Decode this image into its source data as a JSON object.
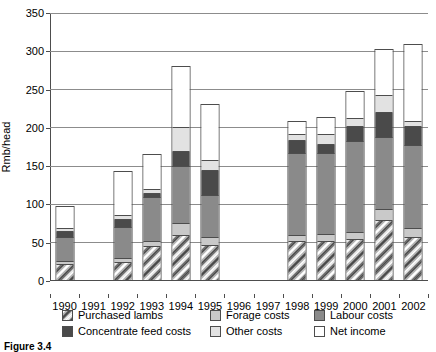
{
  "chart_data": {
    "type": "bar",
    "stacked": true,
    "title": "",
    "xlabel": "",
    "ylabel": "Rmb/head",
    "ylim": [
      0,
      350
    ],
    "yticks": [
      0,
      50,
      100,
      150,
      200,
      250,
      300,
      350
    ],
    "grid": true,
    "legend_position": "bottom",
    "categories": [
      "1990",
      "1991",
      "1992",
      "1993",
      "1994",
      "1995",
      "1996",
      "1997",
      "1998",
      "1999",
      "2000",
      "2001",
      "2002"
    ],
    "series": [
      {
        "name": "Purchased lambs",
        "color": "#808080",
        "values": [
          20,
          null,
          22,
          43,
          57,
          45,
          null,
          null,
          49,
          50,
          52,
          77,
          55
        ]
      },
      {
        "name": "Forage costs",
        "color": "#c9c9c9",
        "values": [
          4,
          null,
          5,
          7,
          16,
          10,
          null,
          null,
          8,
          9,
          10,
          14,
          12
        ]
      },
      {
        "name": "Labour costs",
        "color": "#8a8a8a",
        "values": [
          31,
          null,
          41,
          57,
          75,
          55,
          null,
          null,
          108,
          106,
          118,
          94,
          108
        ]
      },
      {
        "name": "Concentrate feed costs",
        "color": "#4a4a4a",
        "values": [
          8,
          null,
          10,
          5,
          19,
          33,
          null,
          null,
          17,
          11,
          20,
          33,
          25
        ]
      },
      {
        "name": "Other costs",
        "color": "#e2e2e2",
        "values": [
          4,
          null,
          5,
          5,
          31,
          12,
          null,
          null,
          7,
          14,
          10,
          22,
          7
        ]
      },
      {
        "name": "Net income",
        "color": "#ffffff",
        "values": [
          28,
          null,
          58,
          46,
          80,
          73,
          null,
          null,
          18,
          22,
          36,
          60,
          100
        ]
      }
    ],
    "totals": [
      95,
      null,
      141,
      163,
      278,
      228,
      null,
      null,
      207,
      212,
      246,
      300,
      307
    ]
  },
  "legend": {
    "items": [
      {
        "label": "Purchased lambs",
        "swatch": "purchased"
      },
      {
        "label": "Forage costs",
        "swatch": "forage"
      },
      {
        "label": "Labour costs",
        "swatch": "labour"
      },
      {
        "label": "Concentrate feed costs",
        "swatch": "concentrate"
      },
      {
        "label": "Other costs",
        "swatch": "other"
      },
      {
        "label": "Net income",
        "swatch": "netincome"
      }
    ]
  },
  "caption": "Figure 3.4"
}
